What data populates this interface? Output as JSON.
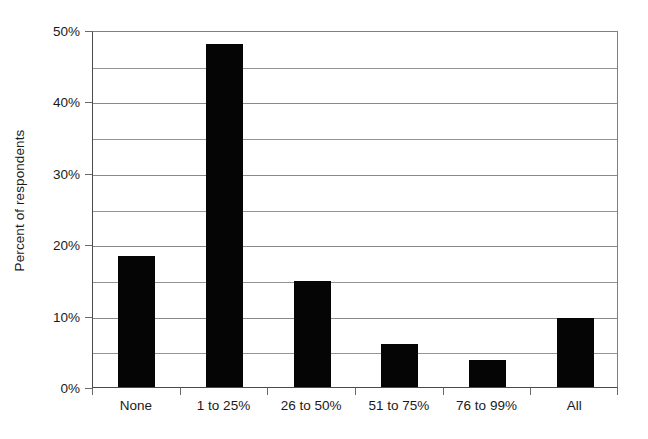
{
  "chart_data": {
    "type": "bar",
    "title": "",
    "subtitle": "",
    "xlabel": "",
    "ylabel": "Percent of respondents",
    "categories": [
      "None",
      "1 to 25%",
      "26 to 50%",
      "51 to 75%",
      "76 to 99%",
      "All"
    ],
    "values": [
      18.3,
      48.0,
      14.8,
      6.0,
      3.8,
      9.7
    ],
    "series": [
      {
        "name": "Percent of respondents",
        "values": [
          18.3,
          48.0,
          14.8,
          6.0,
          3.8,
          9.7
        ]
      }
    ],
    "ylim": [
      0,
      50
    ],
    "xlim": [
      0,
      6
    ],
    "y_major_ticks": [
      0,
      10,
      20,
      30,
      40,
      50
    ],
    "y_minor_ticks": [
      5,
      15,
      25,
      35,
      45
    ],
    "y_tick_labels": [
      "0%",
      "10%",
      "20%",
      "30%",
      "40%",
      "50%"
    ],
    "grid": "horizontal",
    "legend": "none",
    "bar_color": "#050505",
    "axis_color": "#4a4a4a",
    "gridline_color": "#949494",
    "background_color": "#ffffff",
    "annotations": []
  }
}
